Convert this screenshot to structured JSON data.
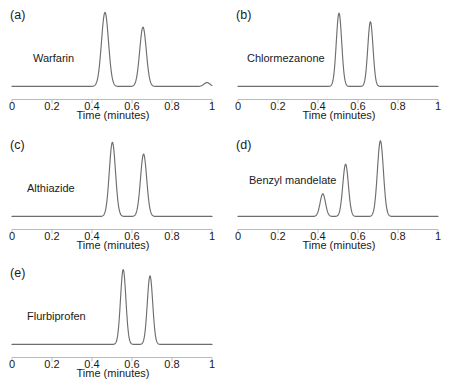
{
  "figure": {
    "background": "#ffffff",
    "trace_color": "#6e6e6e",
    "axis_color": "#b3b3b3",
    "text_color": "#1a1a1a"
  },
  "axis": {
    "title": "Time (minutes)",
    "tick_labels": [
      "0",
      "0.2",
      "0.4",
      "0.6",
      "0.8",
      "1"
    ],
    "tick_values": [
      0,
      0.2,
      0.4,
      0.6,
      0.8,
      1
    ]
  },
  "panels": [
    {
      "id": "a",
      "label": "(a)",
      "compound": "Warfarin"
    },
    {
      "id": "b",
      "label": "(b)",
      "compound": "Chlormezanone"
    },
    {
      "id": "c",
      "label": "(c)",
      "compound": "Althiazide"
    },
    {
      "id": "d",
      "label": "(d)",
      "compound": "Benzyl mandelate"
    },
    {
      "id": "e",
      "label": "(e)",
      "compound": "Flurbiprofen"
    }
  ],
  "chart_data": [
    {
      "type": "line",
      "id": "a",
      "title": "(a) Warfarin",
      "xlabel": "Time (minutes)",
      "ylabel": "",
      "xlim": [
        0,
        1
      ],
      "ylim": [
        0,
        1.05
      ],
      "grid": false,
      "legend": "none",
      "xticks": [
        0,
        0.2,
        0.4,
        0.6,
        0.8,
        1
      ],
      "xticklabels": [
        "0",
        "0.2",
        "0.4",
        "0.6",
        "0.8",
        "1"
      ],
      "annotations": [
        "(a)",
        "Warfarin"
      ],
      "baseline": 0.02,
      "peaks": [
        {
          "center": 0.465,
          "height": 0.95,
          "width": 0.035
        },
        {
          "center": 0.655,
          "height": 0.76,
          "width": 0.033
        },
        {
          "center": 0.975,
          "height": 0.05,
          "width": 0.03
        }
      ]
    },
    {
      "type": "line",
      "id": "b",
      "title": "(b) Chlormezanone",
      "xlabel": "Time (minutes)",
      "ylabel": "",
      "xlim": [
        0,
        1
      ],
      "ylim": [
        0,
        1.05
      ],
      "grid": false,
      "legend": "none",
      "xticks": [
        0,
        0.2,
        0.4,
        0.6,
        0.8,
        1
      ],
      "xticklabels": [
        "0",
        "0.2",
        "0.4",
        "0.6",
        "0.8",
        "1"
      ],
      "annotations": [
        "(b)",
        "Chlormezanone"
      ],
      "baseline": 0.02,
      "peaks": [
        {
          "center": 0.505,
          "height": 0.94,
          "width": 0.027
        },
        {
          "center": 0.662,
          "height": 0.83,
          "width": 0.026
        }
      ]
    },
    {
      "type": "line",
      "id": "c",
      "title": "(c) Althiazide",
      "xlabel": "Time (minutes)",
      "ylabel": "",
      "xlim": [
        0,
        1
      ],
      "ylim": [
        0,
        1.05
      ],
      "grid": false,
      "legend": "none",
      "xticks": [
        0,
        0.2,
        0.4,
        0.6,
        0.8,
        1
      ],
      "xticklabels": [
        "0",
        "0.2",
        "0.4",
        "0.6",
        "0.8",
        "1"
      ],
      "annotations": [
        "(c)",
        "Althiazide"
      ],
      "baseline": 0.02,
      "peaks": [
        {
          "center": 0.502,
          "height": 0.95,
          "width": 0.031
        },
        {
          "center": 0.658,
          "height": 0.8,
          "width": 0.031
        }
      ]
    },
    {
      "type": "line",
      "id": "d",
      "title": "(d) Benzyl mandelate",
      "xlabel": "Time (minutes)",
      "ylabel": "",
      "xlim": [
        0,
        1
      ],
      "ylim": [
        0,
        1.05
      ],
      "grid": false,
      "legend": "none",
      "xticks": [
        0,
        0.2,
        0.4,
        0.6,
        0.8,
        1
      ],
      "xticklabels": [
        "0",
        "0.2",
        "0.4",
        "0.6",
        "0.8",
        "1"
      ],
      "annotations": [
        "(d)",
        "Benzyl mandelate"
      ],
      "baseline": 0.02,
      "peaks": [
        {
          "center": 0.424,
          "height": 0.29,
          "width": 0.027
        },
        {
          "center": 0.538,
          "height": 0.67,
          "width": 0.028
        },
        {
          "center": 0.712,
          "height": 0.97,
          "width": 0.03
        }
      ]
    },
    {
      "type": "line",
      "id": "e",
      "title": "(e) Flurbiprofen",
      "xlabel": "Time (minutes)",
      "ylabel": "",
      "xlim": [
        0,
        1
      ],
      "ylim": [
        0,
        1.05
      ],
      "grid": false,
      "legend": "none",
      "xticks": [
        0,
        0.2,
        0.4,
        0.6,
        0.8,
        1
      ],
      "xticklabels": [
        "0",
        "0.2",
        "0.4",
        "0.6",
        "0.8",
        "1"
      ],
      "annotations": [
        "(e)",
        "Flurbiprofen"
      ],
      "baseline": 0.02,
      "peaks": [
        {
          "center": 0.556,
          "height": 0.96,
          "width": 0.027
        },
        {
          "center": 0.69,
          "height": 0.88,
          "width": 0.027
        }
      ]
    }
  ]
}
